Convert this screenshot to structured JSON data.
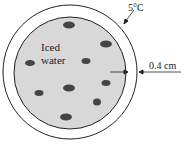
{
  "diagram": {
    "temperature_label": "5°C",
    "contents_label_line1": "Iced",
    "contents_label_line2": "water",
    "thickness_label": "0.4 cm"
  }
}
